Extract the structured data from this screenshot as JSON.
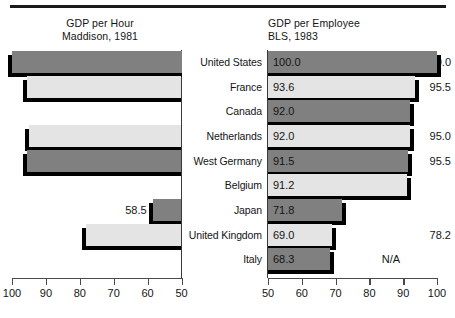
{
  "chart_data": {
    "type": "bar",
    "title": "",
    "orientation": "horizontal",
    "grid": false,
    "legend_position": "none",
    "categories": [
      "United States",
      "France",
      "Canada",
      "Netherlands",
      "West Germany",
      "Belgium",
      "Japan",
      "United Kingdom",
      "Italy"
    ],
    "panels": [
      {
        "id": "gdp-per-hour",
        "title_line1": "GDP per Hour",
        "title_line2": "Maddison, 1981",
        "ylabel": "",
        "xlabel": "",
        "axis_direction": "reversed",
        "xlim": [
          50,
          100
        ],
        "ticks": [
          100,
          90,
          80,
          70,
          60,
          50
        ],
        "tick_labels": [
          "100",
          "90",
          "80",
          "70",
          "60",
          "50"
        ],
        "values": [
          100.0,
          95.5,
          null,
          95.0,
          95.5,
          null,
          58.5,
          78.2,
          null
        ],
        "value_labels": [
          "100.0",
          "95.5",
          "N/A",
          "95.0",
          "95.5",
          "N/A",
          "58.5",
          "78.2",
          "N/A"
        ]
      },
      {
        "id": "gdp-per-employee",
        "title_line1": "GDP per Employee",
        "title_line2": "BLS, 1983",
        "ylabel": "",
        "xlabel": "",
        "axis_direction": "normal",
        "xlim": [
          50,
          100
        ],
        "ticks": [
          50,
          60,
          70,
          80,
          90,
          100
        ],
        "tick_labels": [
          "50",
          "60",
          "70",
          "80",
          "90",
          "100"
        ],
        "values": [
          100.0,
          93.6,
          92.0,
          92.0,
          91.5,
          91.2,
          71.8,
          69.0,
          68.3
        ],
        "value_labels": [
          "100.0",
          "93.6",
          "92.0",
          "92.0",
          "91.5",
          "91.2",
          "71.8",
          "69.0",
          "68.3"
        ]
      }
    ],
    "series": [
      {
        "name": "GDP per Hour (Maddison, 1981)",
        "values": [
          100.0,
          95.5,
          null,
          95.0,
          95.5,
          null,
          58.5,
          78.2,
          null
        ]
      },
      {
        "name": "GDP per Employee (BLS, 1983)",
        "values": [
          100.0,
          93.6,
          92.0,
          92.0,
          91.5,
          91.2,
          71.8,
          69.0,
          68.3
        ]
      }
    ],
    "bar_fill_colors": [
      "#808080",
      "#e4e4e4"
    ],
    "shadow_color": "#000000"
  },
  "left_panel": {
    "title_line1": "GDP per Hour",
    "title_line2": "Maddison, 1981",
    "values": [
      "100.0",
      "95.5",
      "N/A",
      "95.0",
      "95.5",
      "N/A",
      "58.5",
      "78.2",
      "N/A"
    ],
    "axis_labels": [
      "100",
      "90",
      "80",
      "70",
      "60",
      "50"
    ]
  },
  "right_panel": {
    "title_line1": "GDP per Employee",
    "title_line2": "BLS, 1983",
    "values": [
      "100.0",
      "93.6",
      "92.0",
      "92.0",
      "91.5",
      "91.2",
      "71.8",
      "69.0",
      "68.3"
    ],
    "axis_labels": [
      "50",
      "60",
      "70",
      "80",
      "90",
      "100"
    ]
  },
  "countries": [
    "United States",
    "France",
    "Canada",
    "Netherlands",
    "West Germany",
    "Belgium",
    "Japan",
    "United Kingdom",
    "Italy"
  ]
}
